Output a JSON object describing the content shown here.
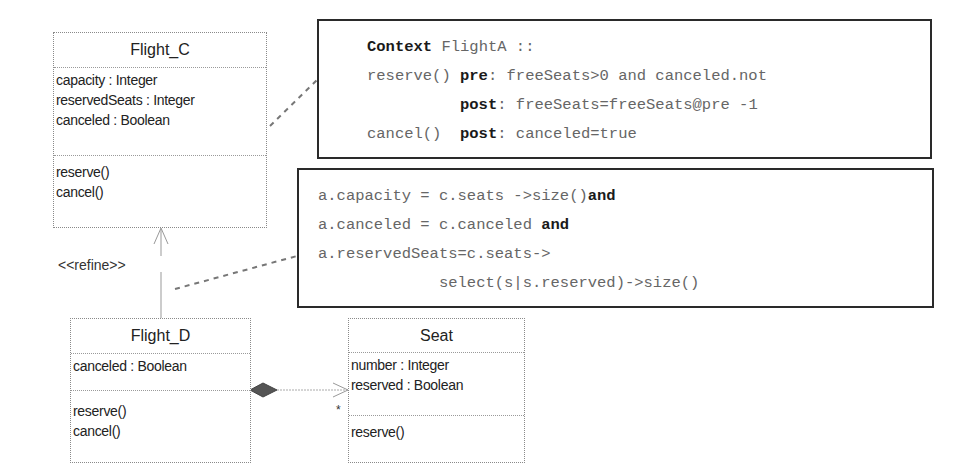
{
  "classes": {
    "flight_c": {
      "name": "Flight_C",
      "attributes": [
        "capacity : Integer",
        "reservedSeats : Integer",
        "canceled : Boolean"
      ],
      "operations": [
        "reserve()",
        "cancel()"
      ]
    },
    "flight_d": {
      "name": "Flight_D",
      "attributes": [
        "canceled : Boolean"
      ],
      "operations": [
        "reserve()",
        "cancel()"
      ]
    },
    "seat": {
      "name": "Seat",
      "attributes": [
        "number : Integer",
        "reserved : Boolean"
      ],
      "operations": [
        "reserve()"
      ]
    }
  },
  "relations": {
    "refine_stereotype": "<<refine>>",
    "composition_multiplicity": "*"
  },
  "ocl_context": {
    "keyword_context": "Context",
    "context_rest": " FlightA ::",
    "line2_a": "reserve() ",
    "kw_pre": "pre",
    "line2_b": ": freeSeats>0 and canceled.not",
    "line3_indent": "          ",
    "kw_post1": "post",
    "line3_b": ": freeSeats=freeSeats@pre -1",
    "line4_a": "cancel()  ",
    "kw_post2": "post",
    "line4_b": ": canceled=true"
  },
  "ocl_mapping": {
    "line1_a": "a.capacity = c.seats ->size()",
    "kw_and1": "and",
    "line2_a": "a.canceled = c.canceled ",
    "kw_and2": "and",
    "line3": "a.reservedSeats=c.seats->",
    "line4": "             select(s|s.reserved)->size()"
  }
}
